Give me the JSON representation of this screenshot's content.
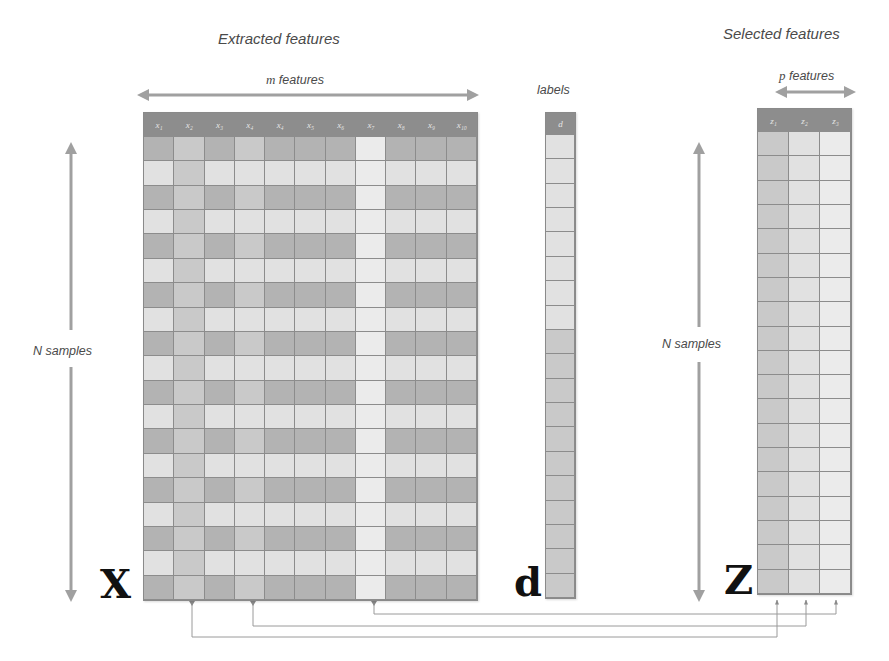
{
  "titles": {
    "extracted": "Extracted features",
    "selected": "Selected features",
    "labels": "labels"
  },
  "dimensions": {
    "m_var": "m",
    "m_text": " features",
    "p_var": "p",
    "p_text": " features",
    "n_left": "N samples",
    "n_right": "N samples"
  },
  "matrices": {
    "X": {
      "symbol": "X",
      "headers": [
        "x₁",
        "x₂",
        "x₃",
        "x₄",
        "x₄",
        "x₅",
        "x₆",
        "x₇",
        "x₈",
        "x₉",
        "x₁₀"
      ],
      "rows": 19,
      "selected_columns": [
        1,
        3,
        7
      ]
    },
    "d": {
      "symbol": "d",
      "headers": [
        "d"
      ],
      "rows": 19
    },
    "Z": {
      "symbol": "Z",
      "headers": [
        "z₁",
        "z₂",
        "z₃"
      ],
      "rows": 19
    }
  },
  "colors": {
    "header": "#8d8d8d",
    "dark_cell": "#b3b3b3",
    "medium_cell": "#c9c9c9",
    "light_cell": "#e1e1e1",
    "arrow": "#a0a0a0",
    "connector": "#9a9a9a"
  }
}
